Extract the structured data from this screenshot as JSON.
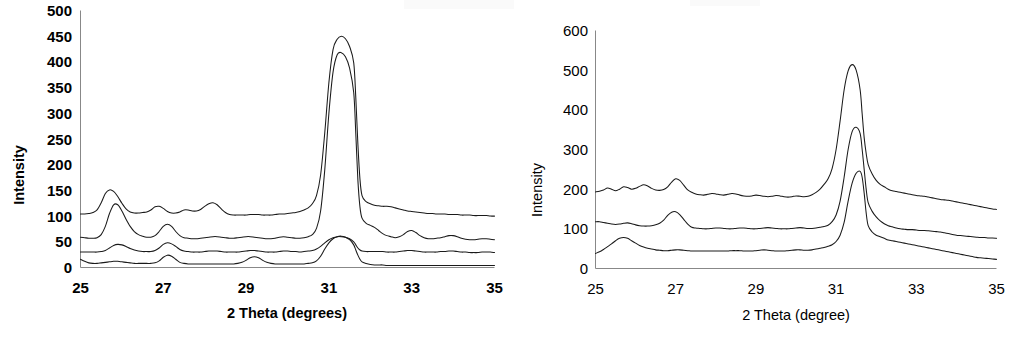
{
  "figure": {
    "name": "xrd-diffractogram-pair",
    "background": "#ffffff",
    "trace_color": "#1a1a1a",
    "axis_color": "#888888"
  },
  "panels": [
    {
      "id": "left",
      "name": "xrd-panel-left",
      "y_axis_title": "Intensity",
      "x_axis_title": "2 Theta (degrees)",
      "y_ticks": [
        "0",
        "50",
        "100",
        "150",
        "200",
        "250",
        "300",
        "350",
        "400",
        "450",
        "500"
      ],
      "x_ticks": [
        "25",
        "27",
        "29",
        "31",
        "33",
        "35"
      ],
      "bold_labels": true
    },
    {
      "id": "right",
      "name": "xrd-panel-right",
      "y_axis_title": "Intensity",
      "x_axis_title": "2 Theta (degree)",
      "y_ticks": [
        "0",
        "100",
        "200",
        "300",
        "400",
        "500",
        "600"
      ],
      "x_ticks": [
        "25",
        "27",
        "29",
        "31",
        "33",
        "35"
      ],
      "bold_labels": false
    }
  ],
  "chart_data": [
    {
      "type": "line",
      "id": "left",
      "title": "",
      "xlabel": "2 Theta (degrees)",
      "ylabel": "Intensity",
      "xlim": [
        25,
        35
      ],
      "ylim": [
        0,
        500
      ],
      "xticks": [
        25,
        27,
        29,
        31,
        33,
        35
      ],
      "yticks": [
        0,
        50,
        100,
        150,
        200,
        250,
        300,
        350,
        400,
        450,
        500
      ],
      "grid": false,
      "legend": "none",
      "x": [
        25.0,
        25.1,
        25.2,
        25.3,
        25.4,
        25.5,
        25.6,
        25.7,
        25.8,
        25.9,
        26.0,
        26.1,
        26.2,
        26.3,
        26.4,
        26.5,
        26.6,
        26.7,
        26.8,
        26.9,
        27.0,
        27.1,
        27.2,
        27.3,
        27.4,
        27.5,
        27.6,
        27.7,
        27.8,
        27.9,
        28.0,
        28.1,
        28.2,
        28.3,
        28.4,
        28.5,
        28.6,
        28.7,
        28.8,
        28.9,
        29.0,
        29.1,
        29.2,
        29.3,
        29.4,
        29.5,
        29.6,
        29.7,
        29.8,
        29.9,
        30.0,
        30.1,
        30.2,
        30.3,
        30.4,
        30.5,
        30.6,
        30.7,
        30.8,
        30.9,
        31.0,
        31.1,
        31.2,
        31.3,
        31.4,
        31.5,
        31.6,
        31.65,
        31.7,
        31.75,
        31.8,
        31.9,
        32.0,
        32.1,
        32.2,
        32.3,
        32.4,
        32.5,
        32.6,
        32.7,
        32.8,
        32.9,
        33.0,
        33.1,
        33.2,
        33.3,
        33.4,
        33.5,
        33.6,
        33.7,
        33.8,
        33.9,
        34.0,
        34.1,
        34.2,
        34.3,
        34.4,
        34.5,
        34.6,
        34.7,
        34.8,
        34.9,
        35.0
      ],
      "series": [
        {
          "name": "trace-1-top",
          "offset": 100,
          "values": [
            104,
            104,
            105,
            107,
            112,
            126,
            144,
            151,
            148,
            138,
            125,
            114,
            108,
            106,
            106,
            107,
            108,
            112,
            118,
            119,
            115,
            109,
            106,
            106,
            108,
            112,
            112,
            110,
            110,
            113,
            119,
            124,
            126,
            122,
            114,
            107,
            103,
            102,
            102,
            102,
            102,
            103,
            103,
            103,
            102,
            102,
            102,
            103,
            104,
            104,
            105,
            106,
            107,
            109,
            112,
            116,
            124,
            140,
            180,
            262,
            360,
            424,
            444,
            450,
            445,
            430,
            398,
            330,
            240,
            172,
            140,
            128,
            124,
            121,
            120,
            119,
            119,
            118,
            116,
            114,
            112,
            110,
            109,
            108,
            107,
            106,
            105,
            105,
            104,
            104,
            104,
            103,
            103,
            103,
            102,
            102,
            102,
            101,
            101,
            101,
            101,
            100,
            100
          ]
        },
        {
          "name": "trace-2",
          "offset": 57,
          "values": [
            59,
            58,
            57,
            57,
            58,
            64,
            80,
            105,
            122,
            122,
            110,
            94,
            80,
            70,
            64,
            61,
            59,
            59,
            62,
            70,
            80,
            84,
            80,
            70,
            62,
            58,
            57,
            56,
            56,
            57,
            58,
            59,
            60,
            60,
            59,
            58,
            57,
            57,
            58,
            59,
            60,
            60,
            59,
            58,
            57,
            56,
            56,
            57,
            59,
            60,
            59,
            58,
            57,
            57,
            58,
            60,
            64,
            76,
            110,
            190,
            300,
            380,
            414,
            418,
            410,
            388,
            340,
            260,
            170,
            118,
            96,
            86,
            82,
            78,
            72,
            66,
            62,
            60,
            58,
            60,
            64,
            70,
            72,
            68,
            62,
            58,
            56,
            56,
            57,
            58,
            60,
            62,
            62,
            60,
            57,
            55,
            54,
            54,
            55,
            56,
            56,
            55,
            54
          ]
        },
        {
          "name": "trace-3",
          "offset": 30,
          "values": [
            30,
            30,
            30,
            30,
            30,
            31,
            33,
            38,
            43,
            45,
            44,
            41,
            37,
            34,
            32,
            31,
            31,
            31,
            33,
            38,
            45,
            48,
            46,
            41,
            35,
            32,
            31,
            30,
            30,
            30,
            31,
            32,
            32,
            32,
            31,
            30,
            30,
            30,
            30,
            31,
            32,
            33,
            33,
            32,
            31,
            30,
            30,
            30,
            31,
            32,
            32,
            31,
            31,
            30,
            31,
            32,
            33,
            36,
            41,
            48,
            54,
            58,
            60,
            60,
            59,
            56,
            50,
            44,
            38,
            34,
            32,
            31,
            31,
            31,
            31,
            31,
            30,
            30,
            30,
            31,
            32,
            33,
            33,
            32,
            31,
            30,
            30,
            30,
            30,
            31,
            31,
            32,
            32,
            31,
            30,
            30,
            29,
            29,
            29,
            30,
            30,
            30,
            29
          ]
        },
        {
          "name": "trace-4-bottom",
          "offset": 0,
          "values": [
            16,
            12,
            9,
            8,
            8,
            9,
            10,
            11,
            12,
            12,
            11,
            10,
            9,
            8,
            8,
            8,
            8,
            8,
            9,
            13,
            20,
            24,
            22,
            16,
            10,
            8,
            7,
            7,
            7,
            7,
            7,
            7,
            7,
            7,
            7,
            7,
            7,
            7,
            8,
            10,
            14,
            19,
            21,
            19,
            14,
            10,
            8,
            7,
            7,
            7,
            7,
            7,
            7,
            7,
            7,
            8,
            9,
            13,
            22,
            36,
            48,
            56,
            60,
            61,
            59,
            54,
            44,
            34,
            24,
            16,
            11,
            8,
            6,
            5,
            5,
            5,
            4,
            4,
            4,
            4,
            4,
            4,
            4,
            4,
            4,
            4,
            4,
            4,
            4,
            4,
            4,
            4,
            4,
            4,
            4,
            4,
            4,
            4,
            4,
            4,
            4,
            4,
            4
          ]
        }
      ]
    },
    {
      "type": "line",
      "id": "right",
      "title": "",
      "xlabel": "2 Theta (degree)",
      "ylabel": "Intensity",
      "xlim": [
        25,
        35
      ],
      "ylim": [
        0,
        600
      ],
      "xticks": [
        25,
        27,
        29,
        31,
        33,
        35
      ],
      "yticks": [
        0,
        100,
        200,
        300,
        400,
        500,
        600
      ],
      "grid": false,
      "legend": "none",
      "x": [
        25.0,
        25.1,
        25.2,
        25.3,
        25.4,
        25.5,
        25.6,
        25.7,
        25.8,
        25.9,
        26.0,
        26.1,
        26.2,
        26.3,
        26.4,
        26.5,
        26.6,
        26.7,
        26.8,
        26.9,
        27.0,
        27.1,
        27.2,
        27.3,
        27.4,
        27.5,
        27.6,
        27.7,
        27.8,
        27.9,
        28.0,
        28.1,
        28.2,
        28.3,
        28.4,
        28.5,
        28.6,
        28.7,
        28.8,
        28.9,
        29.0,
        29.1,
        29.2,
        29.3,
        29.4,
        29.5,
        29.6,
        29.7,
        29.8,
        29.9,
        30.0,
        30.1,
        30.2,
        30.3,
        30.4,
        30.5,
        30.6,
        30.7,
        30.8,
        30.9,
        31.0,
        31.1,
        31.2,
        31.3,
        31.4,
        31.5,
        31.6,
        31.65,
        31.7,
        31.75,
        31.8,
        31.9,
        32.0,
        32.1,
        32.2,
        32.3,
        32.4,
        32.5,
        32.6,
        32.7,
        32.8,
        32.9,
        33.0,
        33.1,
        33.2,
        33.3,
        33.4,
        33.5,
        33.6,
        33.7,
        33.8,
        33.9,
        34.0,
        34.1,
        34.2,
        34.3,
        34.4,
        34.5,
        34.6,
        34.7,
        34.8,
        34.9,
        35.0
      ],
      "series": [
        {
          "name": "trace-1-top",
          "offset": 190,
          "values": [
            193,
            195,
            198,
            203,
            200,
            196,
            200,
            206,
            204,
            200,
            202,
            207,
            211,
            208,
            202,
            198,
            197,
            199,
            206,
            218,
            226,
            222,
            210,
            198,
            192,
            188,
            186,
            185,
            187,
            189,
            188,
            186,
            185,
            187,
            189,
            188,
            185,
            183,
            182,
            183,
            185,
            184,
            182,
            181,
            182,
            184,
            183,
            181,
            180,
            181,
            183,
            182,
            181,
            182,
            186,
            192,
            200,
            212,
            226,
            252,
            300,
            372,
            450,
            498,
            514,
            500,
            450,
            390,
            330,
            290,
            262,
            238,
            222,
            212,
            206,
            200,
            196,
            194,
            192,
            190,
            188,
            186,
            184,
            183,
            182,
            180,
            178,
            176,
            174,
            173,
            172,
            170,
            168,
            166,
            164,
            162,
            160,
            158,
            156,
            154,
            152,
            150,
            149
          ]
        },
        {
          "name": "trace-2-middle",
          "offset": 110,
          "values": [
            118,
            118,
            116,
            114,
            112,
            111,
            112,
            114,
            115,
            113,
            110,
            108,
            107,
            107,
            108,
            110,
            114,
            122,
            134,
            142,
            143,
            136,
            124,
            112,
            104,
            102,
            101,
            100,
            100,
            101,
            102,
            102,
            101,
            100,
            100,
            101,
            102,
            102,
            101,
            100,
            100,
            101,
            102,
            103,
            102,
            101,
            100,
            100,
            100,
            101,
            102,
            103,
            102,
            101,
            101,
            102,
            104,
            106,
            109,
            118,
            135,
            170,
            230,
            300,
            345,
            356,
            340,
            300,
            250,
            200,
            166,
            144,
            130,
            120,
            113,
            108,
            105,
            102,
            100,
            99,
            98,
            98,
            97,
            96,
            96,
            95,
            94,
            93,
            92,
            90,
            88,
            86,
            84,
            83,
            82,
            81,
            80,
            79,
            78,
            78,
            77,
            77,
            76
          ]
        },
        {
          "name": "trace-3-bottom",
          "offset": 40,
          "values": [
            38,
            42,
            48,
            55,
            62,
            70,
            76,
            78,
            76,
            70,
            64,
            58,
            54,
            51,
            49,
            47,
            46,
            45,
            45,
            46,
            47,
            47,
            46,
            45,
            44,
            44,
            44,
            44,
            44,
            44,
            44,
            44,
            44,
            44,
            45,
            45,
            45,
            44,
            44,
            44,
            45,
            46,
            47,
            46,
            45,
            44,
            44,
            44,
            45,
            46,
            47,
            47,
            46,
            46,
            47,
            49,
            51,
            53,
            56,
            60,
            68,
            84,
            116,
            170,
            215,
            240,
            245,
            230,
            190,
            140,
            108,
            92,
            84,
            80,
            76,
            72,
            70,
            68,
            66,
            64,
            62,
            60,
            58,
            56,
            54,
            52,
            50,
            48,
            46,
            44,
            42,
            40,
            38,
            36,
            34,
            32,
            30,
            28,
            27,
            26,
            25,
            24,
            23
          ]
        }
      ]
    }
  ]
}
